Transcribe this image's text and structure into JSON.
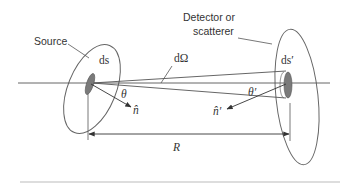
{
  "diagram": {
    "title": "",
    "labels": {
      "source": "Source",
      "detector_line1": "Detector or",
      "detector_line2": "scatterer",
      "ds": "ds",
      "ds_prime": "ds′",
      "solid_angle": "dΩ",
      "theta": "θ",
      "theta_prime": "θ′",
      "n_hat": "n̂",
      "n_hat_prime": "n̂′",
      "distance": "R"
    },
    "colors": {
      "line": "#555555",
      "patch_fill": "#7a7a7a",
      "text": "#333333",
      "rule": "#bbbbbb"
    }
  }
}
